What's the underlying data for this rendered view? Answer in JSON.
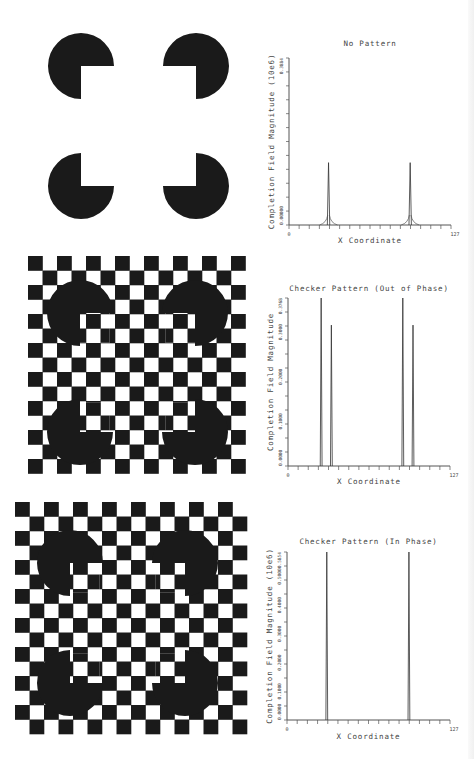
{
  "stimuli": [
    {
      "name": "No Pattern",
      "background": "plain",
      "pacmen": [
        [
          81,
          66
        ],
        [
          196,
          66
        ],
        [
          81,
          186
        ],
        [
          196,
          186
        ]
      ],
      "radius": 33
    },
    {
      "name": "Checker Pattern (Out of Phase)",
      "background": "checker",
      "checker": {
        "x0": 28,
        "y0": 256,
        "cell": 14.5,
        "cols": 15,
        "rows": 15
      },
      "pacmen": [
        [
          80,
          313
        ],
        [
          195,
          313
        ],
        [
          80,
          432
        ],
        [
          195,
          432
        ]
      ],
      "radius": 33
    },
    {
      "name": "Checker Pattern (In Phase)",
      "background": "checker",
      "checker": {
        "x0": 15,
        "y0": 502,
        "cell": 14.5,
        "cols": 16,
        "rows": 16
      },
      "pacmen": [
        [
          70,
          563
        ],
        [
          185,
          563
        ],
        [
          70,
          683
        ],
        [
          185,
          683
        ]
      ],
      "radius": 33
    }
  ],
  "chart_data": [
    {
      "type": "line",
      "title": "No Pattern",
      "xlabel": "X Coordinate",
      "ylabel": "Completion Field Magnitude (10e6)",
      "xlim": [
        0,
        127
      ],
      "ylim": [
        0.0,
        0.3884
      ],
      "x_tick_labels": [
        "0",
        "127"
      ],
      "y_tick_labels": [
        "0.00000",
        "0.3884"
      ],
      "grid": false,
      "series": [
        {
          "name": "completion field",
          "peaks": [
            {
              "x": 31,
              "y": 0.145
            },
            {
              "x": 95,
              "y": 0.145
            }
          ]
        }
      ]
    },
    {
      "type": "line",
      "title": "Checker Pattern (Out of Phase)",
      "xlabel": "X Coordinate",
      "ylabel": "Completion Field Magnitude",
      "xlim": [
        0,
        127
      ],
      "ylim": [
        0.0,
        0.3768
      ],
      "x_tick_labels": [
        "0",
        "127"
      ],
      "y_tick_labels": [
        "0.0000",
        "0.1000",
        "0.2000",
        "0.3000",
        "0.3768"
      ],
      "grid": false,
      "series": [
        {
          "name": "completion field",
          "peaks": [
            {
              "x": 26,
              "y": 0.3768
            },
            {
              "x": 34,
              "y": 0.316
            },
            {
              "x": 90,
              "y": 0.3768
            },
            {
              "x": 98,
              "y": 0.316
            }
          ]
        }
      ]
    },
    {
      "type": "line",
      "title": "Checker Pattern (In Phase)",
      "xlabel": "X Coordinate",
      "ylabel": "Completion Field Magnitude (10e6)",
      "xlim": [
        0,
        127
      ],
      "ylim": [
        0.0,
        0.5854
      ],
      "x_tick_labels": [
        "0",
        "127"
      ],
      "y_tick_labels": [
        "0.0000",
        "0.1000",
        "0.2000",
        "0.3000",
        "0.4000",
        "0.5000",
        "0.5854"
      ],
      "grid": false,
      "series": [
        {
          "name": "completion field",
          "peaks": [
            {
              "x": 31,
              "y": 0.5854
            },
            {
              "x": 95,
              "y": 0.5854
            }
          ]
        }
      ]
    }
  ],
  "charts_layout": [
    {
      "x0": 289,
      "x1": 451,
      "y0": 225,
      "y1": 58,
      "title_y": 46,
      "xlabel_y": 243
    },
    {
      "x0": 288,
      "x1": 450,
      "y0": 466,
      "y1": 298,
      "title_y": 291,
      "xlabel_y": 484
    },
    {
      "x0": 287,
      "x1": 450,
      "y0": 720,
      "y1": 552,
      "title_y": 544,
      "xlabel_y": 739
    }
  ],
  "colors": {
    "ink": "#1a1a1a",
    "axis": "#555555",
    "background": "#ffffff"
  }
}
